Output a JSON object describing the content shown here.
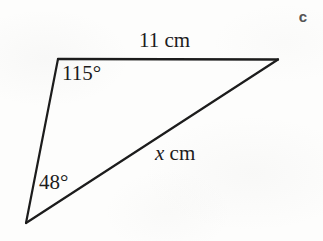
{
  "figure": {
    "part_label": "c",
    "background_color": "#fdfdfc",
    "stroke_color": "#1c1c1c",
    "text_color": "#1c1c1c",
    "labels": {
      "side_top": "11 cm",
      "angle_top": "115°",
      "angle_bottom": "48°",
      "side_hypotenuse_variable": "x",
      "side_hypotenuse_unit": "cm"
    },
    "geometry": {
      "shape": "triangle",
      "vertices": [
        {
          "name": "top-left",
          "x": 58,
          "y": 59
        },
        {
          "name": "top-right",
          "x": 278,
          "y": 59
        },
        {
          "name": "bottom-left",
          "x": 26,
          "y": 223
        }
      ],
      "sides": [
        {
          "name": "top",
          "from": "top-left",
          "to": "top-right",
          "label": "11 cm"
        },
        {
          "name": "hypotenuse",
          "from": "bottom-left",
          "to": "top-right",
          "label": "x cm"
        },
        {
          "name": "left",
          "from": "top-left",
          "to": "bottom-left",
          "label": ""
        }
      ],
      "angles": [
        {
          "at": "top-left",
          "label": "115°"
        },
        {
          "at": "bottom-left",
          "label": "48°"
        }
      ]
    }
  }
}
